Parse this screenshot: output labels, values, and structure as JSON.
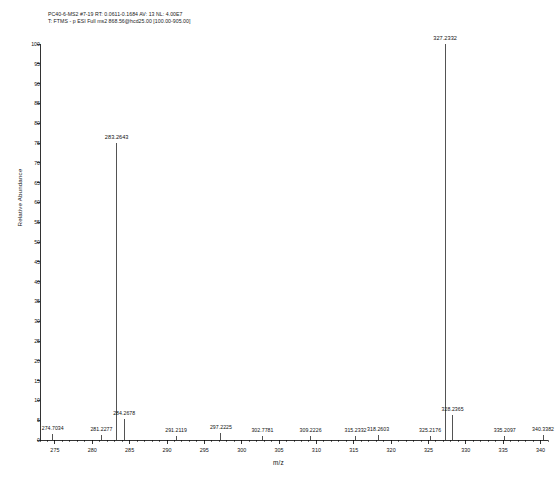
{
  "header": {
    "line1": "PC40-6-MS2 #7-19  RT: 0.0611-0.1684  AV: 13  NL: 4.00E7",
    "line2": "T: FTMS - p ESI Full ms2 868.56@hcd25.00 [100.00-905.00]"
  },
  "chart_data": {
    "type": "bar",
    "title": "",
    "xlabel": "m/z",
    "ylabel": "Relative Abundance",
    "xlim": [
      273.0,
      341.0
    ],
    "ylim": [
      0,
      100
    ],
    "grid": false,
    "legend": null,
    "xticks": [
      275,
      280,
      285,
      290,
      295,
      300,
      305,
      310,
      315,
      320,
      325,
      330,
      335,
      340
    ],
    "xtick_labels": [
      "275",
      "280",
      "285",
      "290",
      "295",
      "300",
      "305",
      "310",
      "315",
      "320",
      "325",
      "330",
      "335",
      "340"
    ],
    "xtick_minor_step": 1,
    "yticks": [
      0,
      5,
      10,
      15,
      20,
      25,
      30,
      35,
      40,
      45,
      50,
      55,
      60,
      65,
      70,
      75,
      80,
      85,
      90,
      95,
      100
    ],
    "ytick_labels": [
      "0",
      "5",
      "10",
      "15",
      "20",
      "25",
      "30",
      "35",
      "40",
      "45",
      "50",
      "55",
      "60",
      "65",
      "70",
      "75",
      "80",
      "85",
      "90",
      "95",
      "100"
    ],
    "peaks": [
      {
        "mz": 274.7034,
        "label": "274.7034",
        "intensity": 1.4,
        "label_side": "center"
      },
      {
        "mz": 281.2277,
        "label": "281.2277",
        "intensity": 1.2,
        "label_side": "center"
      },
      {
        "mz": 283.2643,
        "label": "283.2643",
        "intensity": 75.0,
        "label_side": "center"
      },
      {
        "mz": 284.2678,
        "label": "284.2678",
        "intensity": 5.4,
        "label_side": "center"
      },
      {
        "mz": 291.2119,
        "label": "291.2119",
        "intensity": 1.1,
        "label_side": "center"
      },
      {
        "mz": 297.2225,
        "label": "297.2225",
        "intensity": 1.8,
        "label_side": "center"
      },
      {
        "mz": 302.7781,
        "label": "302.7781",
        "intensity": 1.0,
        "label_side": "center"
      },
      {
        "mz": 309.2226,
        "label": "309.2226",
        "intensity": 1.0,
        "label_side": "center"
      },
      {
        "mz": 315.2332,
        "label": "315.2332",
        "intensity": 1.0,
        "label_side": "center"
      },
      {
        "mz": 318.2603,
        "label": "318.2603",
        "intensity": 1.2,
        "label_side": "center"
      },
      {
        "mz": 325.2176,
        "label": "325.2176",
        "intensity": 1.1,
        "label_side": "center"
      },
      {
        "mz": 327.2332,
        "label": "327.2332",
        "intensity": 100.0,
        "label_side": "center"
      },
      {
        "mz": 328.2365,
        "label": "328.2365",
        "intensity": 6.2,
        "label_side": "center"
      },
      {
        "mz": 335.2097,
        "label": "335.2097",
        "intensity": 1.0,
        "label_side": "center"
      },
      {
        "mz": 340.3382,
        "label": "340.3382",
        "intensity": 1.2,
        "label_side": "center"
      }
    ]
  },
  "colors": {
    "axis": "#000000",
    "trace": "#1a1a1a",
    "text": "#111111",
    "background": "#ffffff"
  }
}
